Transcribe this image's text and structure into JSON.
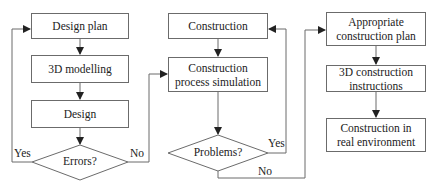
{
  "diagram": {
    "type": "flowchart",
    "column1": {
      "steps": [
        "Design plan",
        "3D modelling",
        "Design"
      ],
      "decision": "Errors?",
      "yes_label": "Yes",
      "no_label": "No"
    },
    "column2": {
      "steps": [
        "Construction",
        "Construction process simulation"
      ],
      "step2_line1": "Construction",
      "step2_line2": "process simulation",
      "decision": "Problems?",
      "yes_label": "Yes",
      "no_label": "No"
    },
    "column3": {
      "step1_line1": "Appropriate",
      "step1_line2": "construction plan",
      "step2_line1": "3D construction",
      "step2_line2": "instructions",
      "step3_line1": "Construction in",
      "step3_line2": "real environment"
    },
    "colors": {
      "line": "#6b6b6b",
      "arrow": "#222222",
      "background": "#ffffff"
    }
  }
}
